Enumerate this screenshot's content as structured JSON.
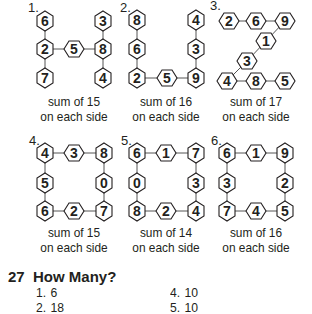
{
  "colors": {
    "ink": "#231f20",
    "hex_fill": "#ffffff",
    "line": "#555555"
  },
  "puzzles": [
    {
      "label": "1.",
      "caption_line1": "sum of 15",
      "caption_line2": "on each side",
      "shape": "H",
      "nodes": [
        {
          "v": "6",
          "x": 45,
          "y": 21,
          "o": "p"
        },
        {
          "v": "2",
          "x": 45,
          "y": 49,
          "o": "p"
        },
        {
          "v": "7",
          "x": 45,
          "y": 78,
          "o": "p"
        },
        {
          "v": "5",
          "x": 74,
          "y": 49,
          "o": "f"
        },
        {
          "v": "3",
          "x": 103,
          "y": 21,
          "o": "p"
        },
        {
          "v": "8",
          "x": 103,
          "y": 49,
          "o": "p"
        },
        {
          "v": "4",
          "x": 103,
          "y": 78,
          "o": "p"
        }
      ],
      "edges": [
        [
          0,
          1
        ],
        [
          1,
          2
        ],
        [
          1,
          3
        ],
        [
          3,
          5
        ],
        [
          4,
          5
        ],
        [
          5,
          6
        ]
      ]
    },
    {
      "label": "2.",
      "caption_line1": "sum of 16",
      "caption_line2": "on each side",
      "shape": "U",
      "nodes": [
        {
          "v": "8",
          "x": 137,
          "y": 20,
          "o": "p"
        },
        {
          "v": "6",
          "x": 137,
          "y": 49,
          "o": "p"
        },
        {
          "v": "2",
          "x": 137,
          "y": 78,
          "o": "p"
        },
        {
          "v": "5",
          "x": 167,
          "y": 78,
          "o": "f"
        },
        {
          "v": "9",
          "x": 196,
          "y": 78,
          "o": "p"
        },
        {
          "v": "3",
          "x": 196,
          "y": 49,
          "o": "p"
        },
        {
          "v": "4",
          "x": 196,
          "y": 20,
          "o": "p"
        }
      ],
      "edges": [
        [
          0,
          1
        ],
        [
          1,
          2
        ],
        [
          2,
          3
        ],
        [
          3,
          4
        ],
        [
          4,
          5
        ],
        [
          5,
          6
        ]
      ]
    },
    {
      "label": "3.",
      "caption_line1": "sum of 17",
      "caption_line2": "on each side",
      "shape": "Z",
      "nodes": [
        {
          "v": "2",
          "x": 229,
          "y": 21,
          "o": "f"
        },
        {
          "v": "6",
          "x": 256,
          "y": 21,
          "o": "f"
        },
        {
          "v": "9",
          "x": 285,
          "y": 21,
          "o": "f"
        },
        {
          "v": "1",
          "x": 266,
          "y": 41,
          "o": "f"
        },
        {
          "v": "3",
          "x": 247,
          "y": 61,
          "o": "f"
        },
        {
          "v": "4",
          "x": 227,
          "y": 81,
          "o": "f"
        },
        {
          "v": "8",
          "x": 256,
          "y": 81,
          "o": "f"
        },
        {
          "v": "5",
          "x": 285,
          "y": 81,
          "o": "f"
        }
      ],
      "edges": [
        [
          0,
          1
        ],
        [
          1,
          2
        ],
        [
          2,
          3
        ],
        [
          3,
          4
        ],
        [
          4,
          5
        ],
        [
          5,
          6
        ],
        [
          6,
          7
        ]
      ]
    },
    {
      "label": "4.",
      "caption_line1": "sum of 15",
      "caption_line2": "on each side",
      "shape": "square",
      "nodes": [
        {
          "v": "4",
          "x": 45,
          "y": 153,
          "o": "p"
        },
        {
          "v": "3",
          "x": 74,
          "y": 153,
          "o": "f"
        },
        {
          "v": "8",
          "x": 104,
          "y": 153,
          "o": "p"
        },
        {
          "v": "0",
          "x": 104,
          "y": 183,
          "o": "p"
        },
        {
          "v": "7",
          "x": 104,
          "y": 211,
          "o": "p"
        },
        {
          "v": "2",
          "x": 74,
          "y": 211,
          "o": "f"
        },
        {
          "v": "6",
          "x": 45,
          "y": 211,
          "o": "p"
        },
        {
          "v": "5",
          "x": 45,
          "y": 183,
          "o": "p"
        }
      ],
      "edges": [
        [
          0,
          1
        ],
        [
          1,
          2
        ],
        [
          2,
          3
        ],
        [
          3,
          4
        ],
        [
          4,
          5
        ],
        [
          5,
          6
        ],
        [
          6,
          7
        ],
        [
          7,
          0
        ]
      ]
    },
    {
      "label": "5.",
      "caption_line1": "sum of 14",
      "caption_line2": "on each side",
      "shape": "square",
      "nodes": [
        {
          "v": "6",
          "x": 137,
          "y": 153,
          "o": "p"
        },
        {
          "v": "1",
          "x": 166,
          "y": 153,
          "o": "f"
        },
        {
          "v": "7",
          "x": 196,
          "y": 153,
          "o": "p"
        },
        {
          "v": "3",
          "x": 196,
          "y": 183,
          "o": "p"
        },
        {
          "v": "4",
          "x": 196,
          "y": 211,
          "o": "p"
        },
        {
          "v": "2",
          "x": 166,
          "y": 211,
          "o": "f"
        },
        {
          "v": "8",
          "x": 137,
          "y": 211,
          "o": "p"
        },
        {
          "v": "0",
          "x": 137,
          "y": 183,
          "o": "p"
        }
      ],
      "edges": [
        [
          0,
          1
        ],
        [
          1,
          2
        ],
        [
          2,
          3
        ],
        [
          3,
          4
        ],
        [
          4,
          5
        ],
        [
          5,
          6
        ],
        [
          6,
          7
        ],
        [
          7,
          0
        ]
      ]
    },
    {
      "label": "6.",
      "caption_line1": "sum of 16",
      "caption_line2": "on each side",
      "shape": "square",
      "nodes": [
        {
          "v": "6",
          "x": 227,
          "y": 153,
          "o": "p"
        },
        {
          "v": "1",
          "x": 256,
          "y": 153,
          "o": "f"
        },
        {
          "v": "9",
          "x": 285,
          "y": 153,
          "o": "p"
        },
        {
          "v": "2",
          "x": 285,
          "y": 183,
          "o": "p"
        },
        {
          "v": "5",
          "x": 285,
          "y": 211,
          "o": "p"
        },
        {
          "v": "4",
          "x": 256,
          "y": 211,
          "o": "f"
        },
        {
          "v": "7",
          "x": 227,
          "y": 211,
          "o": "p"
        },
        {
          "v": "3",
          "x": 227,
          "y": 183,
          "o": "p"
        }
      ],
      "edges": [
        [
          0,
          1
        ],
        [
          1,
          2
        ],
        [
          2,
          3
        ],
        [
          3,
          4
        ],
        [
          4,
          5
        ],
        [
          5,
          6
        ],
        [
          6,
          7
        ],
        [
          7,
          0
        ]
      ]
    }
  ],
  "section": {
    "number": "27",
    "title": "How Many?",
    "answers": [
      {
        "n": "1.",
        "value": "6"
      },
      {
        "n": "2.",
        "value": "18"
      },
      {
        "n": "4.",
        "value": "10"
      },
      {
        "n": "5.",
        "value": "10"
      }
    ]
  }
}
